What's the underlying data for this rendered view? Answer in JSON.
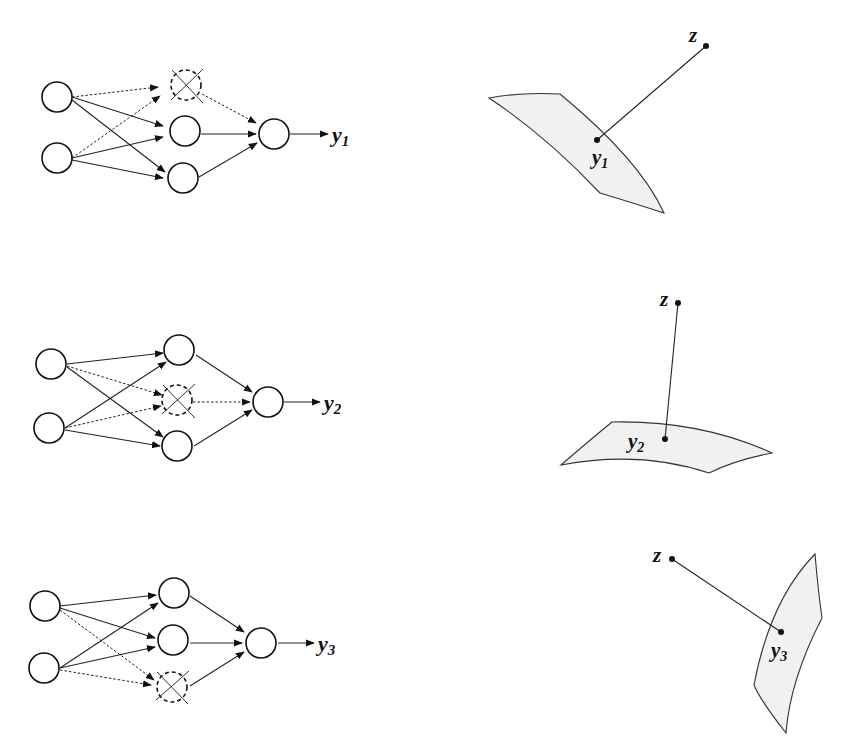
{
  "figure": {
    "rows": [
      {
        "network": {
          "dropped_hidden_node": "top",
          "output_label": "y",
          "output_subscript": "1"
        },
        "projection": {
          "point_label": "z",
          "surface_point_label": "y",
          "surface_point_subscript": "1"
        }
      },
      {
        "network": {
          "dropped_hidden_node": "middle",
          "output_label": "y",
          "output_subscript": "2"
        },
        "projection": {
          "point_label": "z",
          "surface_point_label": "y",
          "surface_point_subscript": "2"
        }
      },
      {
        "network": {
          "dropped_hidden_node": "bottom",
          "output_label": "y",
          "output_subscript": "3"
        },
        "projection": {
          "point_label": "z",
          "surface_point_label": "y",
          "surface_point_subscript": "3"
        }
      }
    ]
  }
}
